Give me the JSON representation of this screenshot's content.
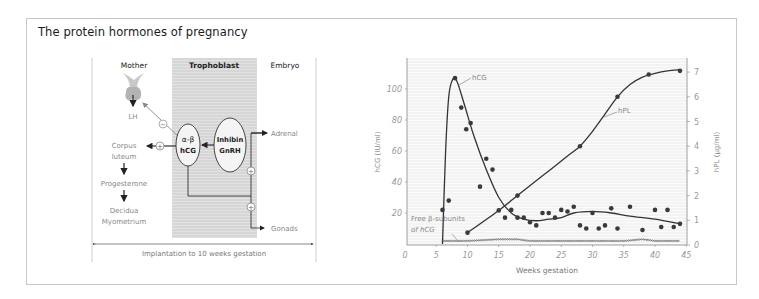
{
  "title": "The protein hormones of pregnancy",
  "diagram": {
    "columns": [
      "Mother",
      "Trophoblast",
      "Embryo"
    ],
    "mother_items": [
      "LH",
      "Corpus",
      "luteum",
      "Progesterone",
      "Decidua",
      "Myometrium"
    ],
    "trophoblast_items": {
      "hcg_top": "α-β",
      "hcg_bottom": "hCG",
      "inhibin": "Inhibin",
      "gnrh": "GnRH"
    },
    "embryo_items": [
      "Adrenal",
      "Gonads"
    ],
    "signs": {
      "minus": "−",
      "plus": "+"
    },
    "footer": "Implantation to 10 weeks gestation",
    "colors": {
      "trophoblast_fill": "#d9d9d9",
      "pituitary": "#b8b8b8",
      "text_gray": "#7a7a7a"
    }
  },
  "chart_data": {
    "type": "line",
    "title": "",
    "xlabel": "Weeks gestation",
    "ylabel_left": "hCG (IU/ml)",
    "ylabel_right": "hPL (µg/ml)",
    "xlim": [
      0,
      45
    ],
    "ylim_left": [
      0,
      120
    ],
    "ylim_right": [
      0,
      7.5
    ],
    "x_ticks": [
      "0",
      "5",
      "10",
      "15",
      "20",
      "25",
      "30",
      "35",
      "40",
      "45"
    ],
    "y_left_ticks": [
      "20",
      "40",
      "60",
      "80",
      "100"
    ],
    "y_right_ticks": [
      "0",
      "1",
      "2",
      "3",
      "4",
      "5",
      "6",
      "7"
    ],
    "grid": false,
    "annotations": [
      "hCG",
      "hPL",
      "Free β-subunits",
      "of hCG"
    ],
    "series": [
      {
        "name": "hCG",
        "axis": "left",
        "curve": [
          [
            6,
            0
          ],
          [
            6.5,
            60
          ],
          [
            7,
            95
          ],
          [
            7.6,
            106
          ],
          [
            8.3,
            105
          ],
          [
            9.5,
            90
          ],
          [
            11,
            70
          ],
          [
            13,
            48
          ],
          [
            15,
            30
          ],
          [
            17,
            20
          ],
          [
            19,
            16
          ],
          [
            21,
            15
          ],
          [
            23,
            16
          ],
          [
            25,
            17
          ],
          [
            27,
            20
          ],
          [
            30,
            21
          ],
          [
            33,
            20
          ],
          [
            36,
            18
          ],
          [
            40,
            16
          ],
          [
            44,
            13
          ]
        ],
        "points": [
          [
            6,
            22
          ],
          [
            7,
            28
          ],
          [
            8,
            107
          ],
          [
            9,
            88
          ],
          [
            9.8,
            74
          ],
          [
            10.5,
            78
          ],
          [
            12,
            37
          ],
          [
            13,
            55
          ],
          [
            14,
            48
          ],
          [
            16,
            17
          ],
          [
            17,
            22
          ],
          [
            18,
            17
          ],
          [
            19,
            17
          ],
          [
            20,
            14
          ],
          [
            21,
            12
          ],
          [
            22,
            20
          ],
          [
            23,
            20
          ],
          [
            24,
            17
          ],
          [
            25,
            22
          ],
          [
            26,
            21
          ],
          [
            27,
            24
          ],
          [
            28,
            12
          ],
          [
            29,
            10
          ],
          [
            30,
            20
          ],
          [
            31,
            10
          ],
          [
            32,
            12
          ],
          [
            33,
            23
          ],
          [
            34,
            10
          ],
          [
            36,
            24
          ],
          [
            38,
            9
          ],
          [
            40,
            22
          ],
          [
            41,
            11
          ],
          [
            42,
            22
          ],
          [
            43,
            11
          ],
          [
            44,
            13
          ]
        ]
      },
      {
        "name": "hPL",
        "axis": "right",
        "curve": [
          [
            10,
            0.5
          ],
          [
            15,
            1.4
          ],
          [
            18,
            2.0
          ],
          [
            22,
            2.8
          ],
          [
            26,
            3.6
          ],
          [
            28,
            4.0
          ],
          [
            30,
            4.6
          ],
          [
            32,
            5.3
          ],
          [
            34,
            6.0
          ],
          [
            36,
            6.5
          ],
          [
            38,
            6.8
          ],
          [
            40,
            6.95
          ],
          [
            42,
            7.05
          ],
          [
            44,
            7.1
          ]
        ],
        "points": [
          [
            10,
            0.5
          ],
          [
            15,
            1.4
          ],
          [
            18,
            2.0
          ],
          [
            28,
            4.0
          ],
          [
            34,
            6.0
          ],
          [
            39,
            6.9
          ],
          [
            44,
            7.05
          ]
        ]
      },
      {
        "name": "Free β-subunits of hCG",
        "axis": "left",
        "curve": [
          [
            6,
            2
          ],
          [
            10,
            2
          ],
          [
            15,
            3
          ],
          [
            18,
            3
          ],
          [
            20,
            2
          ],
          [
            25,
            2
          ],
          [
            30,
            2
          ],
          [
            35,
            2
          ],
          [
            38,
            3
          ],
          [
            40,
            2
          ],
          [
            42,
            2
          ],
          [
            44,
            2
          ]
        ]
      }
    ]
  }
}
